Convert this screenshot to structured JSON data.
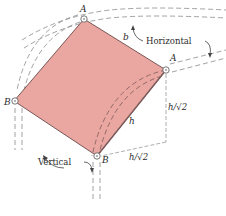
{
  "diagram": {
    "type": "mechanics-figure",
    "colors": {
      "plate_fill": "#eaa6a0",
      "plate_edge": "#6b4a4a",
      "dashed_line": "#7a7a7a",
      "text": "#2b2b2b"
    },
    "labels": {
      "pin_top": "A",
      "pin_right": "A",
      "pin_left": "B",
      "pin_bottom": "B",
      "side_b": "b",
      "diagonal_h": "h",
      "horizontal": "Horizontal",
      "vertical": "Vertical",
      "h_over_root2_vertical": "h/√2",
      "h_over_root2_horizontal": "h/√2"
    }
  }
}
